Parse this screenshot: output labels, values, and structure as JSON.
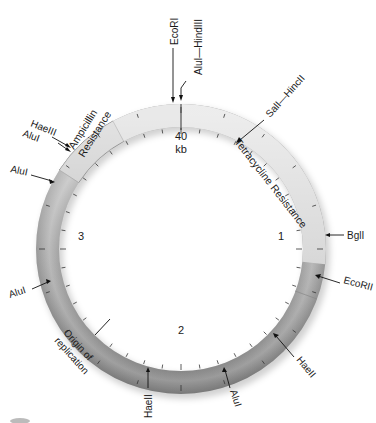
{
  "diagram": {
    "type": "plasmid-map",
    "center_label": {
      "value": "40",
      "unit": "kb"
    },
    "scale_labels": [
      {
        "text": "1",
        "angle": 90
      },
      {
        "text": "2",
        "angle": 180
      },
      {
        "text": "3",
        "angle": 270
      }
    ],
    "regions": [
      {
        "name": "Tetracycline Resistance",
        "start_angle": 0,
        "end_angle": 96,
        "color": "#d4d4d4"
      },
      {
        "name": "Ampicillin Resistance",
        "start_angle": 303,
        "end_angle": 332,
        "color": "#c4c4c4"
      },
      {
        "name": "Origin of replication",
        "angle": 225
      }
    ],
    "region_labels": {
      "tetracycline": "Tetracycline Resistance",
      "ampicillin_line1": "Ampicillin",
      "ampicillin_line2": "Resistance",
      "origin_line1": "Origin of",
      "origin_line2": "replication"
    },
    "restriction_sites": [
      {
        "name": "EcoRI",
        "angle": 0
      },
      {
        "name": "AluI—HindIII",
        "angle": 3
      },
      {
        "name": "SalI—HincII",
        "angle": 45
      },
      {
        "name": "BglI",
        "angle": 91
      },
      {
        "name": "EcoRII",
        "angle": 110
      },
      {
        "name": "HaeII",
        "angle": 137
      },
      {
        "name": "AluI",
        "angle": 163
      },
      {
        "name": "HaeII",
        "angle": 199
      },
      {
        "name": "AluI",
        "angle": 245
      },
      {
        "name": "AluI",
        "angle": 293
      },
      {
        "name": "AluI",
        "angle": 305
      },
      {
        "name": "HaeIII",
        "angle": 308
      }
    ],
    "ring": {
      "center_x": 181,
      "center_y": 249,
      "outer_radius": 145,
      "inner_radius": 122
    }
  }
}
